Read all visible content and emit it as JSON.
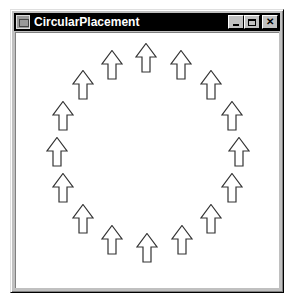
{
  "window": {
    "title": "CircularPlacement",
    "buttons": {
      "minimize": "_",
      "maximize": "□",
      "close": "✕"
    }
  },
  "canvas": {
    "shape": "up-arrow",
    "arrow_count": 16,
    "arrows": [
      {
        "x": 146,
        "y": 43
      },
      {
        "x": 181,
        "y": 50
      },
      {
        "x": 211,
        "y": 70
      },
      {
        "x": 232,
        "y": 101
      },
      {
        "x": 239,
        "y": 137
      },
      {
        "x": 232,
        "y": 173
      },
      {
        "x": 211,
        "y": 204
      },
      {
        "x": 182,
        "y": 225
      },
      {
        "x": 147,
        "y": 233
      },
      {
        "x": 112,
        "y": 225
      },
      {
        "x": 83,
        "y": 204
      },
      {
        "x": 63,
        "y": 173
      },
      {
        "x": 57,
        "y": 137
      },
      {
        "x": 63,
        "y": 101
      },
      {
        "x": 83,
        "y": 70
      },
      {
        "x": 112,
        "y": 50
      }
    ],
    "colors": {
      "stroke": "#333333",
      "fill": "#ffffff"
    }
  }
}
